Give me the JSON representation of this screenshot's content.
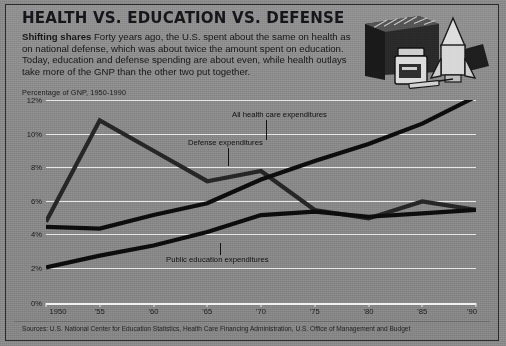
{
  "header": {
    "title": "HEALTH VS. EDUCATION VS. DEFENSE",
    "deck_lead": "Shifting shares",
    "deck_body": "Forty years ago, the U.S. spent about the same on health as on national defense, which was about twice the amount spent on education.  Today,  education and defense spending are about even, while health outlays take more of the GNP than the other two put together."
  },
  "illustration": {
    "alt": "books, pill bottle, syringe and rocket",
    "items": [
      "books-icon",
      "pill-bottle-icon",
      "syringe-icon",
      "rocket-icon"
    ]
  },
  "axis_caption": "Percentage of GNP, 1950-1990",
  "source": "Sources: U.S. National Center for Education Statistics, Health Care Financing Administration, U.S. Office of Management and Budget",
  "colors": {
    "background": "#8b8b8b",
    "frame": "#2b2b2b",
    "gridline": "#e8e8e8",
    "line_health": "#0d0d0d",
    "line_defense": "#232323",
    "line_education": "#0d0d0d",
    "text": "#171717"
  },
  "chart_data": {
    "type": "line",
    "title": "HEALTH VS. EDUCATION VS. DEFENSE",
    "subtitle": "Percentage of GNP, 1950-1990",
    "xlabel": "",
    "ylabel": "Percentage of GNP",
    "x": [
      1950,
      1955,
      1960,
      1965,
      1970,
      1975,
      1980,
      1985,
      1990
    ],
    "xtick_labels": [
      "1950",
      "'55",
      "'60",
      "'65",
      "'70",
      "'75",
      "'80",
      "'85",
      "'90"
    ],
    "ytick_labels": [
      "12%",
      "10%",
      "8%",
      "6%",
      "4%",
      "2%",
      "0%"
    ],
    "ytick_values": [
      12,
      10,
      8,
      6,
      4,
      2,
      0
    ],
    "ylim": [
      0,
      13
    ],
    "xlim": [
      1950,
      1990
    ],
    "grid": true,
    "legend": "inline-annotations",
    "series": [
      {
        "name": "All health care expenditures",
        "label_x": 1971.5,
        "values": [
          4.5,
          4.4,
          5.2,
          5.9,
          7.3,
          8.4,
          9.4,
          10.6,
          12.2
        ]
      },
      {
        "name": "Defense expenditures",
        "label_x": 1964.5,
        "values": [
          4.8,
          10.8,
          9.0,
          7.2,
          7.8,
          5.5,
          5.0,
          6.0,
          5.5
        ]
      },
      {
        "name": "Public education expenditures",
        "label_x": 1964.0,
        "values": [
          2.1,
          2.8,
          3.4,
          4.2,
          5.2,
          5.4,
          5.1,
          5.3,
          5.5
        ]
      }
    ],
    "annotations": [
      {
        "text": "All health care expenditures",
        "series": "All health care expenditures"
      },
      {
        "text": "Defense expenditures",
        "series": "Defense expenditures"
      },
      {
        "text": "Public education expenditures",
        "series": "Public education expenditures"
      }
    ]
  }
}
